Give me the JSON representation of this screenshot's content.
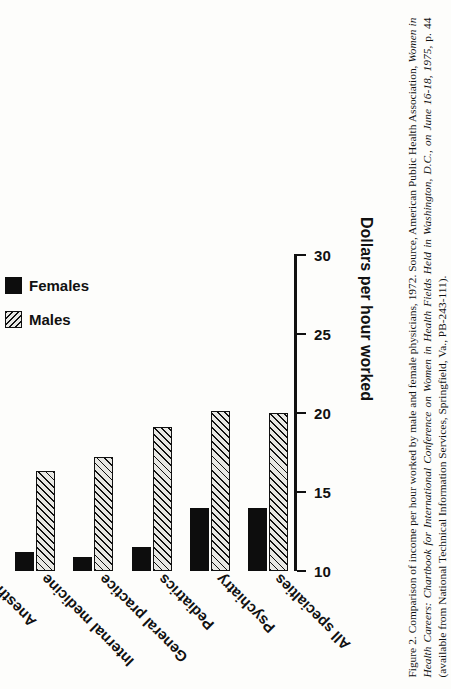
{
  "figure": {
    "caption_label": "Figure 2.",
    "caption_text": "Comparison of income per hour worked by male and female physicians, 1972. Source, American Public Health Association,",
    "caption_line2_italic": "Women in Health Careers: Chartbook for International Conference on Women in Health Fields Held in Washington, D.C., on June 16-18, 1975,",
    "caption_line2_tail": "p. 44 (available from National Technical Information Services, Springfield, Va., PB-243-111)."
  },
  "legend": {
    "position": "top-left-of-plot",
    "entries": [
      {
        "label": "Males",
        "swatch": "hatched",
        "color": "#e8e8e4"
      },
      {
        "label": "Females",
        "swatch": "solid",
        "color": "#0d0d0d"
      }
    ]
  },
  "axis": {
    "title": "Dollars per hour worked",
    "ticks": [
      "10",
      "15",
      "20",
      "25",
      "30"
    ],
    "min": 10,
    "max": 30
  },
  "chart_data": {
    "type": "bar",
    "orientation": "horizontal-printed-sideways",
    "title": "",
    "xlabel": "",
    "ylabel": "Dollars per hour worked",
    "ylim": [
      10,
      30
    ],
    "yticks": [
      10,
      15,
      20,
      25,
      30
    ],
    "grid": false,
    "legend_position": "upper-left",
    "categories": [
      "Radiology",
      "Surgery",
      "Ob/Gyn",
      "Anesthes",
      "Internal medicine",
      "General practice",
      "Pediatrics",
      "Psychiatry",
      "All specialties"
    ],
    "series": [
      {
        "name": "Males",
        "values": [
          27.2,
          22.0,
          21.0,
          19.9,
          16.3,
          17.2,
          19.1,
          20.1,
          20.0
        ]
      },
      {
        "name": "Females",
        "values": [
          18.2,
          20.6,
          17.0,
          15.8,
          11.2,
          10.9,
          11.5,
          14.0,
          14.0
        ]
      }
    ]
  }
}
